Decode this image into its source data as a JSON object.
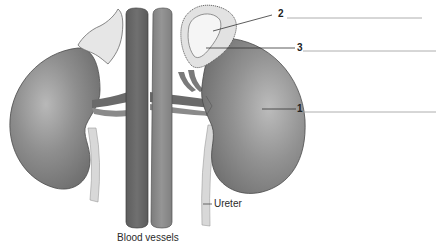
{
  "diagram": {
    "callouts": [
      {
        "number": "1",
        "target": "right-side kidney",
        "answer_line": true
      },
      {
        "number": "2",
        "target": "adrenal gland outer layer",
        "answer_line": true
      },
      {
        "number": "3",
        "target": "adrenal gland inner part",
        "answer_line": true
      }
    ],
    "labels": {
      "ureter": "Ureter",
      "blood_vessels": "Blood vessels"
    },
    "numbers": {
      "one": "1",
      "two": "2",
      "three": "3"
    },
    "colors": {
      "kidney": "#8a8a8a",
      "kidney_highlight": "#b4b4b4",
      "vein": "#6e6e6e",
      "artery": "#8c8c8c",
      "adrenal": "#e4e4e4",
      "ureter": "#d8d8d8",
      "leader_line": "#333333",
      "answer_line": "#999999"
    }
  }
}
